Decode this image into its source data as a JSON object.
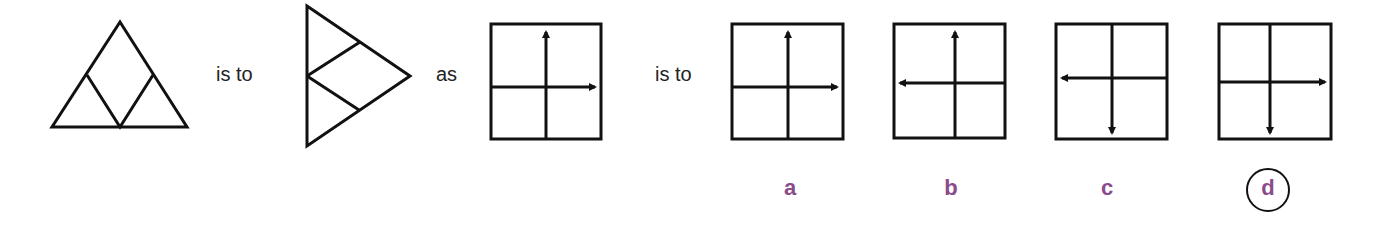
{
  "puzzle": {
    "connector_1": "is to",
    "connector_2": "as",
    "connector_3": "is to",
    "figures": {
      "source_a": {
        "shape": "triangle-apex-up-with-inner-rhombus"
      },
      "source_b": {
        "shape": "triangle-apex-right-with-inner-rhombus"
      },
      "target": {
        "shape": "square-cross",
        "vertical_arrow": "up",
        "horizontal_arrow": "right"
      }
    },
    "options": [
      {
        "label": "a",
        "vertical_arrow": "up",
        "horizontal_arrow": "right",
        "selected": false
      },
      {
        "label": "b",
        "vertical_arrow": "up",
        "horizontal_arrow": "left",
        "selected": false
      },
      {
        "label": "c",
        "vertical_arrow": "down",
        "horizontal_arrow": "left",
        "selected": false
      },
      {
        "label": "d",
        "vertical_arrow": "down",
        "horizontal_arrow": "right",
        "selected": true
      }
    ],
    "label_color": "#8a4a8c",
    "line_color": "#111111"
  }
}
